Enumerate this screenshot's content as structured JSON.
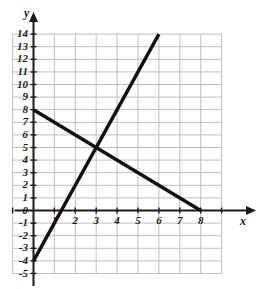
{
  "figure": {
    "background_color": "#ffffff",
    "grid_color": "#b8b8c0",
    "axis_color": "#1a1a1a",
    "line_color": "#111111"
  },
  "axes": {
    "x_name": "x",
    "y_name": "y",
    "x_ticks": [
      "1",
      "2",
      "3",
      "4",
      "5",
      "6",
      "7",
      "8"
    ],
    "y_ticks": [
      "14",
      "13",
      "12",
      "11",
      "10",
      "9",
      "8",
      "7",
      "6",
      "5",
      "4",
      "3",
      "2",
      "1",
      "0",
      "-1",
      "-2",
      "-3",
      "-4",
      "-5"
    ]
  },
  "chart_data": {
    "type": "line",
    "title": "",
    "xlabel": "x",
    "ylabel": "y",
    "xlim": [
      -1,
      9
    ],
    "ylim": [
      -5,
      14
    ],
    "xticks": [
      1,
      2,
      3,
      4,
      5,
      6,
      7,
      8
    ],
    "yticks": [
      -5,
      -4,
      -3,
      -2,
      -1,
      0,
      1,
      2,
      3,
      4,
      5,
      6,
      7,
      8,
      9,
      10,
      11,
      12,
      13,
      14
    ],
    "grid": true,
    "legend": "none",
    "series": [
      {
        "name": "ascending-line",
        "equation": "y = 3x - 4",
        "slope": 3,
        "intercept": -4,
        "x": [
          0,
          6
        ],
        "values": [
          -4,
          14
        ],
        "endpoints": [
          [
            0,
            -4
          ],
          [
            6,
            14
          ]
        ]
      },
      {
        "name": "descending-line",
        "equation": "y = -x + 8",
        "slope": -1,
        "intercept": 8,
        "x": [
          0,
          8
        ],
        "values": [
          8,
          0
        ],
        "endpoints": [
          [
            0,
            8
          ],
          [
            8,
            0
          ]
        ]
      }
    ],
    "intersection": [
      3,
      5
    ]
  }
}
